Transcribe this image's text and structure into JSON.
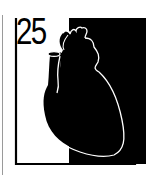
{
  "icon": {
    "number": "25",
    "subject": "heart-icon",
    "colors": {
      "background": "#ffffff",
      "foreground": "#000000",
      "outline": "#ffffff",
      "side_rule": "#9a9a9a"
    }
  }
}
